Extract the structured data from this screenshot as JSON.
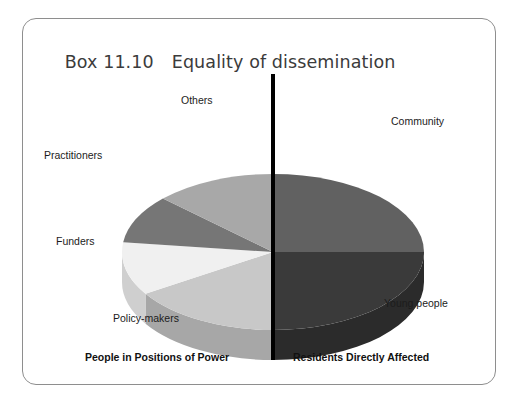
{
  "figure": {
    "title_number": "Box 11.10",
    "title_text": "Equality of dissemination",
    "frame_color": "#8e8e8e",
    "background": "#ffffff"
  },
  "divider": {
    "name": "vertical-divider",
    "color": "#000000",
    "orientation": "vertical"
  },
  "groups": {
    "left_caption": "People in Positions of Power",
    "right_caption": "Residents Directly Affected"
  },
  "labels": {
    "others": "Others",
    "community": "Community",
    "practitioners": "Practitioners",
    "funders": "Funders",
    "policy_makers": "Policy-makers",
    "young_people": "Young people"
  },
  "chart_data": {
    "type": "pie",
    "title": "Equality of dissemination",
    "subtitle": "Box 11.10",
    "three_d": true,
    "legend": "none",
    "grid": false,
    "xlabel": "",
    "ylabel": "",
    "categories": [
      "Community",
      "Young people",
      "Policy-makers",
      "Funders",
      "Practitioners",
      "Others"
    ],
    "values": [
      25,
      25,
      16,
      11,
      10,
      13
    ],
    "colors": [
      "#616161",
      "#3a3a3a",
      "#c8c8c8",
      "#f0f0f0",
      "#767676",
      "#a8a8a8"
    ],
    "side_colors": [
      "#4c4c4c",
      "#2b2b2b",
      "#a7a7a7",
      "#cfcfcf",
      "#5e5e5e",
      "#8a8a8a"
    ],
    "annotations": [
      "People in Positions of Power",
      "Residents Directly Affected"
    ]
  }
}
